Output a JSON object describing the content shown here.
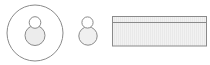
{
  "diagram": {
    "shapes": [
      {
        "id": "avatar-in-circle",
        "kind": "person-in-circle-icon"
      },
      {
        "id": "avatar-plain",
        "kind": "person-icon"
      },
      {
        "id": "banner-rect",
        "kind": "rectangle-with-header-icon"
      }
    ],
    "colors": {
      "stroke": "#8a8a8a",
      "fill": "#efefef",
      "background": "#ffffff"
    }
  }
}
